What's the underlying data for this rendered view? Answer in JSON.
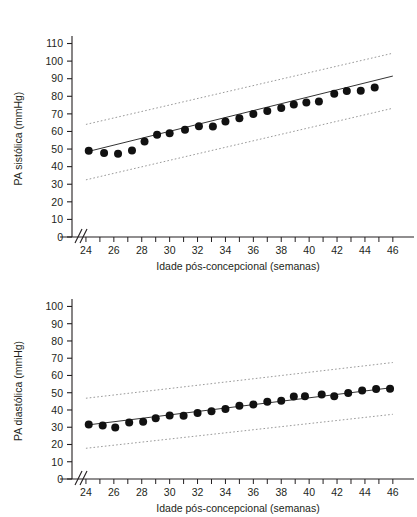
{
  "figure": {
    "background": "#ffffff",
    "ink": "#231f20",
    "point_color": "#111111",
    "fit_line_color": "#333333",
    "band_color": "#9a9a9a"
  },
  "charts": [
    {
      "id": "systolic",
      "chart_data": {
        "type": "scatter",
        "title": "",
        "xlabel": "Idade pós-concepcional (semanas)",
        "ylabel": "PA sistólica (mmHg)",
        "xlim": [
          23,
          46.8
        ],
        "ylim": [
          0,
          112
        ],
        "grid": false,
        "legend": "none",
        "axis_break_x": true,
        "ytick_labels": [
          "0",
          "10",
          "20",
          "30",
          "40",
          "50",
          "60",
          "70",
          "80",
          "90",
          "100",
          "110"
        ],
        "ytick_values": [
          0,
          10,
          20,
          30,
          40,
          50,
          60,
          70,
          80,
          90,
          100,
          110
        ],
        "xtick_labels": [
          "24",
          "26",
          "28",
          "30",
          "32",
          "34",
          "36",
          "38",
          "40",
          "42",
          "44",
          "46"
        ],
        "xtick_values": [
          24,
          26,
          28,
          30,
          32,
          34,
          36,
          38,
          40,
          42,
          44,
          46
        ],
        "xtick_minor_values": [
          24,
          25,
          26,
          27,
          28,
          29,
          30,
          31,
          32,
          33,
          34,
          35,
          36,
          37,
          38,
          39,
          40,
          41,
          42,
          43,
          44,
          45,
          46
        ],
        "x": [
          24.2,
          25.3,
          26.3,
          27.3,
          28.2,
          29.1,
          30.0,
          31.1,
          32.1,
          33.1,
          34.0,
          35.0,
          36.0,
          37.0,
          38.0,
          38.9,
          39.8,
          40.7,
          41.8,
          42.7,
          43.7,
          44.7
        ],
        "values": [
          49.0,
          47.8,
          47.3,
          49.2,
          54.3,
          58.2,
          59.0,
          61.0,
          63.0,
          62.8,
          65.7,
          67.5,
          70.0,
          71.7,
          73.3,
          75.3,
          76.5,
          77.0,
          81.5,
          83.0,
          83.2,
          85.0
        ],
        "series": [
          {
            "name": "Média observada",
            "type": "scatter",
            "x": [
              24.2,
              25.3,
              26.3,
              27.3,
              28.2,
              29.1,
              30.0,
              31.1,
              32.1,
              33.1,
              34.0,
              35.0,
              36.0,
              37.0,
              38.0,
              38.9,
              39.8,
              40.7,
              41.8,
              42.7,
              43.7,
              44.7
            ],
            "values": [
              49.0,
              47.8,
              47.3,
              49.2,
              54.3,
              58.2,
              59.0,
              61.0,
              63.0,
              62.8,
              65.7,
              67.5,
              70.0,
              71.7,
              73.3,
              75.3,
              76.5,
              77.0,
              81.5,
              83.0,
              83.2,
              85.0
            ]
          },
          {
            "name": "Linha de regressão",
            "type": "line",
            "x": [
              24.0,
              46.0
            ],
            "values": [
              48.3,
              91.5
            ]
          },
          {
            "name": "Limite superior",
            "type": "dotted-line",
            "x": [
              24.0,
              46.0
            ],
            "values": [
              64.0,
              104.5
            ]
          },
          {
            "name": "Limite inferior",
            "type": "dotted-line",
            "x": [
              24.0,
              46.0
            ],
            "values": [
              32.5,
              73.2
            ]
          }
        ]
      }
    },
    {
      "id": "diastolic",
      "chart_data": {
        "type": "scatter",
        "title": "",
        "xlabel": "Idade pós-concepcional (semanas)",
        "ylabel": "PA diastólica (mmHg)",
        "xlim": [
          23,
          46.8
        ],
        "ylim": [
          0,
          102
        ],
        "grid": false,
        "legend": "none",
        "axis_break_x": true,
        "ytick_labels": [
          "0",
          "10",
          "20",
          "30",
          "40",
          "50",
          "60",
          "70",
          "80",
          "90",
          "100"
        ],
        "ytick_values": [
          0,
          10,
          20,
          30,
          40,
          50,
          60,
          70,
          80,
          90,
          100
        ],
        "xtick_labels": [
          "24",
          "26",
          "28",
          "30",
          "32",
          "34",
          "36",
          "38",
          "40",
          "42",
          "44",
          "46"
        ],
        "xtick_values": [
          24,
          26,
          28,
          30,
          32,
          34,
          36,
          38,
          40,
          42,
          44,
          46
        ],
        "xtick_minor_values": [
          24,
          25,
          26,
          27,
          28,
          29,
          30,
          31,
          32,
          33,
          34,
          35,
          36,
          37,
          38,
          39,
          40,
          41,
          42,
          43,
          44,
          45,
          46
        ],
        "x": [
          24.2,
          25.2,
          26.1,
          27.1,
          28.1,
          29.0,
          30.0,
          31.0,
          32.0,
          33.0,
          34.0,
          35.0,
          36.0,
          37.0,
          38.0,
          38.9,
          39.7,
          40.9,
          41.8,
          42.8,
          43.8,
          44.8,
          45.8
        ],
        "values": [
          31.6,
          31.0,
          29.8,
          32.7,
          33.2,
          35.2,
          36.8,
          36.6,
          38.3,
          39.2,
          40.6,
          42.4,
          43.2,
          44.8,
          45.4,
          47.8,
          47.9,
          49.0,
          47.9,
          49.8,
          51.3,
          52.1,
          52.3
        ],
        "series": [
          {
            "name": "Média observada",
            "type": "scatter",
            "x": [
              24.2,
              25.2,
              26.1,
              27.1,
              28.1,
              29.0,
              30.0,
              31.0,
              32.0,
              33.0,
              34.0,
              35.0,
              36.0,
              37.0,
              38.0,
              38.9,
              39.7,
              40.9,
              41.8,
              42.8,
              43.8,
              44.8,
              45.8
            ],
            "values": [
              31.6,
              31.0,
              29.8,
              32.7,
              33.2,
              35.2,
              36.8,
              36.6,
              38.3,
              39.2,
              40.6,
              42.4,
              43.2,
              44.8,
              45.4,
              47.8,
              47.9,
              49.0,
              47.9,
              49.8,
              51.3,
              52.1,
              52.3
            ]
          },
          {
            "name": "Linha de regressão",
            "type": "line",
            "x": [
              24.0,
              46.0
            ],
            "values": [
              31.2,
              53.0
            ]
          },
          {
            "name": "Limite superior",
            "type": "dotted-line",
            "x": [
              24.0,
              46.0
            ],
            "values": [
              46.8,
              67.5
            ]
          },
          {
            "name": "Limite inferior",
            "type": "dotted-line",
            "x": [
              24.0,
              46.0
            ],
            "values": [
              17.8,
              37.5
            ]
          }
        ]
      }
    }
  ]
}
